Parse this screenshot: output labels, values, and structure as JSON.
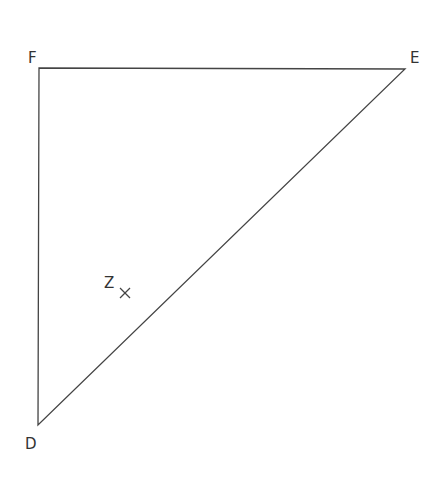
{
  "diagram": {
    "type": "triangle",
    "stroke_color": "#444444",
    "points": {
      "F": {
        "label": "F",
        "x": 39,
        "y": 68
      },
      "E": {
        "label": "E",
        "x": 405,
        "y": 69
      },
      "D": {
        "label": "D",
        "x": 38,
        "y": 425
      }
    },
    "marker": {
      "label": "Z",
      "symbol": "×",
      "x": 125,
      "y": 293
    }
  }
}
